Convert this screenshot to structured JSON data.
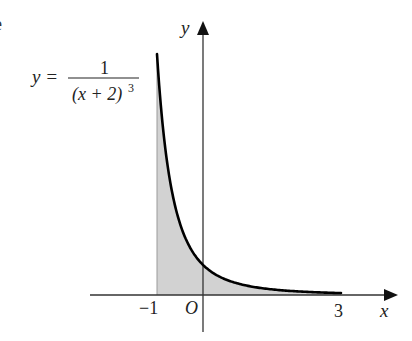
{
  "equation": {
    "lhs": "y =",
    "numerator": "1",
    "denominator_base": "(x + 2)",
    "denominator_exp": "3"
  },
  "axes": {
    "x_label": "x",
    "y_label": "y",
    "origin_label": "O",
    "tick_neg1": "−1",
    "tick_3": "3"
  },
  "edge_glyph": "e",
  "colors": {
    "curve": "#000000",
    "axis": "#333333",
    "shade": "#d2d2d2"
  },
  "region": {
    "function": "1/(x+2)^3",
    "x_from": -1,
    "x_to": 3
  }
}
